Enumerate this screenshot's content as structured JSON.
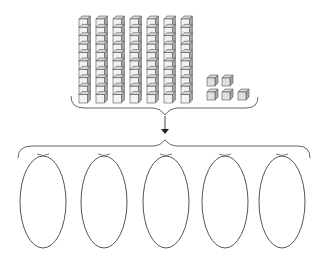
{
  "diagram": {
    "blocks": {
      "tens_rods": 7,
      "cubes_per_rod": 10,
      "units": 5,
      "total_value": 75
    },
    "groups": {
      "count": 5,
      "shape": "ellipse",
      "contents": [
        "",
        "",
        "",
        "",
        ""
      ]
    },
    "colors": {
      "stroke": "#555555",
      "cube_face": "#f2f2f2",
      "cube_top": "#d8d8d8",
      "cube_side": "#a8a8a8",
      "unit_face": "#e0e0e0",
      "brace": "#666666",
      "arrow": "#222222"
    },
    "layout": {
      "rods": {
        "x_start": 79,
        "spacing": 17,
        "top": 16,
        "cube_size": 8.4,
        "depth": 3
      },
      "units": [
        {
          "x": 207,
          "y": 75
        },
        {
          "x": 222,
          "y": 75
        },
        {
          "x": 207,
          "y": 89
        },
        {
          "x": 222,
          "y": 89
        },
        {
          "x": 238,
          "y": 89
        }
      ],
      "ellipses": [
        {
          "cx": 43,
          "cy": 202,
          "rx": 23,
          "ry": 46
        },
        {
          "cx": 104,
          "cy": 202,
          "rx": 23,
          "ry": 46
        },
        {
          "cx": 166,
          "cy": 202,
          "rx": 23,
          "ry": 46
        },
        {
          "cx": 225,
          "cy": 202,
          "rx": 23,
          "ry": 46
        },
        {
          "cx": 282,
          "cy": 202,
          "rx": 23,
          "ry": 46
        }
      ]
    }
  }
}
